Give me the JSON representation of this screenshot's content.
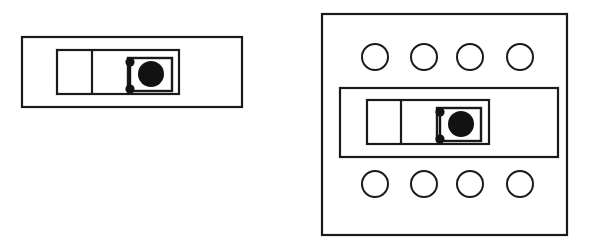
{
  "figure": {
    "background_color": "#ffffff",
    "stroke_color": "#1a1a1a",
    "fill_color": "#121212"
  },
  "chart_data": {
    "type": "diagram",
    "units": "pixels",
    "canvas": {
      "width": 589,
      "height": 248
    },
    "panels": [
      {
        "id": "left-panel",
        "label": "Standalone assembly",
        "shapes": [
          {
            "name": "outer-frame",
            "kind": "rect",
            "x": 22,
            "y": 37,
            "width": 220,
            "height": 70,
            "stroke_width": 2.2,
            "filled": false
          },
          {
            "name": "inner-frame",
            "kind": "rect",
            "x": 57,
            "y": 50,
            "width": 122,
            "height": 44,
            "stroke_width": 2.2,
            "filled": false
          },
          {
            "name": "inner-divider",
            "kind": "line",
            "x1": 92,
            "y1": 50,
            "x2": 92,
            "y2": 94,
            "stroke_width": 2.2
          },
          {
            "name": "core-box",
            "kind": "rect",
            "x": 128,
            "y": 58,
            "width": 44,
            "height": 33,
            "stroke_width": 2.4,
            "filled": false
          },
          {
            "name": "core-disc",
            "kind": "circle",
            "cx": 151,
            "cy": 74,
            "r": 13,
            "filled": true
          },
          {
            "name": "upper-node",
            "kind": "circle",
            "cx": 130,
            "cy": 62,
            "r": 4.6,
            "filled": true
          },
          {
            "name": "lower-node",
            "kind": "circle",
            "cx": 130,
            "cy": 89,
            "r": 4.6,
            "filled": true
          },
          {
            "name": "node-connector",
            "kind": "line",
            "x1": 130,
            "y1": 62,
            "x2": 130,
            "y2": 89,
            "stroke_width": 2.4
          }
        ]
      },
      {
        "id": "right-panel",
        "label": "Assembly mounted in plate",
        "shapes": [
          {
            "name": "mounting-plate",
            "kind": "rect",
            "x": 322,
            "y": 14,
            "width": 245,
            "height": 221,
            "stroke_width": 2.2,
            "filled": false
          },
          {
            "name": "outer-frame",
            "kind": "rect",
            "x": 340,
            "y": 88,
            "width": 218,
            "height": 69,
            "stroke_width": 2.2,
            "filled": false
          },
          {
            "name": "inner-frame",
            "kind": "rect",
            "x": 367,
            "y": 100,
            "width": 122,
            "height": 44,
            "stroke_width": 2.2,
            "filled": false
          },
          {
            "name": "inner-divider",
            "kind": "line",
            "x1": 401,
            "y1": 100,
            "x2": 401,
            "y2": 144,
            "stroke_width": 2.2
          },
          {
            "name": "core-box",
            "kind": "rect",
            "x": 437,
            "y": 108,
            "width": 44,
            "height": 33,
            "stroke_width": 2.4,
            "filled": false
          },
          {
            "name": "core-disc",
            "kind": "circle",
            "cx": 461,
            "cy": 124,
            "r": 13,
            "filled": true
          },
          {
            "name": "upper-node",
            "kind": "circle",
            "cx": 440,
            "cy": 112,
            "r": 4.6,
            "filled": true
          },
          {
            "name": "lower-node",
            "kind": "circle",
            "cx": 440,
            "cy": 139,
            "r": 4.6,
            "filled": true
          },
          {
            "name": "node-connector",
            "kind": "line",
            "x1": 440,
            "y1": 112,
            "x2": 440,
            "y2": 139,
            "stroke_width": 2.4
          }
        ],
        "hole_rows": [
          {
            "name": "top-hole-row",
            "cy": 57,
            "r": 13,
            "stroke_width": 2.0,
            "holes": [
              {
                "name": "hole-top-1",
                "cx": 375
              },
              {
                "name": "hole-top-2",
                "cx": 424
              },
              {
                "name": "hole-top-3",
                "cx": 470
              },
              {
                "name": "hole-top-4",
                "cx": 520
              }
            ]
          },
          {
            "name": "bottom-hole-row",
            "cy": 184,
            "r": 13,
            "stroke_width": 2.0,
            "holes": [
              {
                "name": "hole-bottom-1",
                "cx": 375
              },
              {
                "name": "hole-bottom-2",
                "cx": 424
              },
              {
                "name": "hole-bottom-3",
                "cx": 470
              },
              {
                "name": "hole-bottom-4",
                "cx": 520
              }
            ]
          }
        ]
      }
    ]
  }
}
